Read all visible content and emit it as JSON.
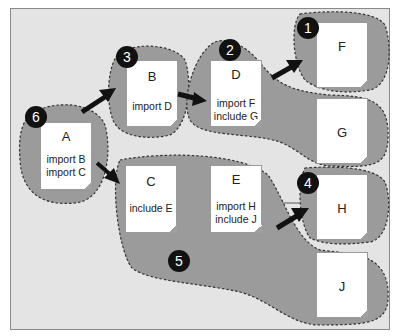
{
  "diagram": {
    "colors": {
      "background": "#e4e4e4",
      "region_fill": "#9b9b9b",
      "region_border": "#333333",
      "document": "#ffffff",
      "badge": "#111111",
      "arrow": "#111111"
    },
    "documents": [
      {
        "id": "A",
        "title": "A",
        "lines": [
          "import B",
          "import C"
        ]
      },
      {
        "id": "B",
        "title": "B",
        "lines": [
          "import D"
        ]
      },
      {
        "id": "C",
        "title": "C",
        "lines": [
          "include E"
        ]
      },
      {
        "id": "D",
        "title": "D",
        "lines": [
          "import F",
          "include G"
        ]
      },
      {
        "id": "E",
        "title": "E",
        "lines": [
          "import H",
          "include J"
        ]
      },
      {
        "id": "F",
        "title": "F",
        "lines": []
      },
      {
        "id": "G",
        "title": "G",
        "lines": []
      },
      {
        "id": "H",
        "title": "H",
        "lines": []
      },
      {
        "id": "J",
        "title": "J",
        "lines": []
      }
    ],
    "badges": [
      {
        "label": "1",
        "region": "F"
      },
      {
        "label": "2",
        "region": "D+G"
      },
      {
        "label": "3",
        "region": "B"
      },
      {
        "label": "4",
        "region": "H"
      },
      {
        "label": "5",
        "region": "C+E+J"
      },
      {
        "label": "6",
        "region": "A"
      }
    ],
    "arrows": [
      {
        "from": "A",
        "to": "B"
      },
      {
        "from": "A",
        "to": "C"
      },
      {
        "from": "B",
        "to": "D"
      },
      {
        "from": "D",
        "to": "F"
      },
      {
        "from": "E",
        "to": "H"
      }
    ]
  }
}
